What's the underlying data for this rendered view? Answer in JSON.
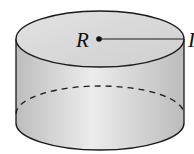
{
  "diagram": {
    "type": "cylinder",
    "labels": {
      "center": "R",
      "edge_partial": "I"
    },
    "colors": {
      "stroke": "#1a1a1a",
      "top_fill": "#d6d6d6",
      "side_fill": "#cfcfcf",
      "side_highlight": "#eaeaea",
      "background": "#ffffff"
    }
  }
}
